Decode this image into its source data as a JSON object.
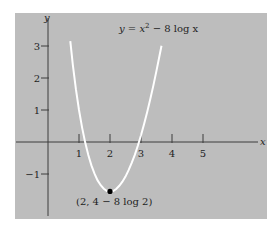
{
  "colors": {
    "page_background": "#ffffff",
    "panel_background": "#bdbdbd",
    "axis": "#3c3c3c",
    "curve": "#ffffff",
    "point": "#000000",
    "text": "#1e1e1e"
  },
  "chart_data": {
    "type": "line",
    "xlabel": "x",
    "ylabel": "y",
    "xlim": [
      -1,
      6.7
    ],
    "ylim": [
      -2.5,
      4
    ],
    "grid": false,
    "legend": null,
    "x_ticks": [
      1,
      2,
      3,
      4,
      5
    ],
    "x_tick_labels": [
      "1",
      "2",
      "3",
      "4",
      "5"
    ],
    "y_ticks": [
      3,
      2,
      1,
      -1
    ],
    "y_tick_labels": [
      "3",
      "2",
      "1",
      "−1"
    ],
    "function": "y = x^2 - 8 ln x",
    "x_range": [
      0.72,
      3.66
    ],
    "series": [
      {
        "name": "y = x² − 8 log x",
        "x": [
          0.72,
          0.8,
          0.9,
          1.0,
          1.1,
          1.2,
          1.3,
          1.4,
          1.5,
          1.6,
          1.7,
          1.8,
          1.9,
          2.0,
          2.1,
          2.2,
          2.3,
          2.4,
          2.5,
          2.6,
          2.7,
          2.8,
          2.9,
          3.0,
          3.1,
          3.2,
          3.3,
          3.4,
          3.5,
          3.6,
          3.66
        ],
        "y": [
          3.15,
          2.42,
          1.65,
          1.0,
          0.45,
          -0.02,
          -0.41,
          -0.73,
          -0.99,
          -1.2,
          -1.35,
          -1.46,
          -1.53,
          -1.55,
          -1.53,
          -1.47,
          -1.37,
          -1.24,
          -1.08,
          -0.88,
          -0.65,
          -0.4,
          -0.11,
          0.21,
          0.56,
          0.94,
          1.34,
          1.77,
          2.23,
          2.71,
          3.01
        ]
      }
    ],
    "annotations": [
      {
        "type": "point",
        "x": 2,
        "y": -1.545,
        "label": "(2, 4 − 8 log 2)"
      },
      {
        "type": "text",
        "label": "y = x² − 8 log x",
        "position": "top-center"
      }
    ]
  },
  "labels": {
    "equation_prefix": "y = x",
    "equation_exp": "2",
    "equation_suffix": " − 8 log x",
    "min_point": "(2, 4 − 8 log 2)",
    "x_axis": "x",
    "y_axis": "y"
  }
}
